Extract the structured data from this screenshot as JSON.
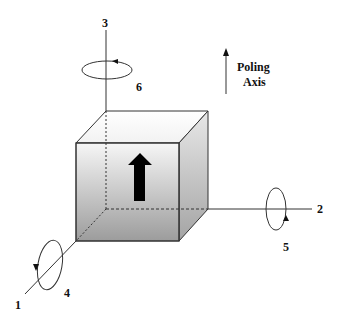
{
  "diagram": {
    "type": "piezoelectric-axes-cube",
    "axes": [
      {
        "id": "axis-1",
        "label": "1",
        "direction": "front-left diagonal"
      },
      {
        "id": "axis-2",
        "label": "2",
        "direction": "right"
      },
      {
        "id": "axis-3",
        "label": "3",
        "direction": "up"
      }
    ],
    "rotations": [
      {
        "id": "rotation-4",
        "label": "4",
        "about_axis": "1"
      },
      {
        "id": "rotation-5",
        "label": "5",
        "about_axis": "2"
      },
      {
        "id": "rotation-6",
        "label": "6",
        "about_axis": "3"
      }
    ],
    "legend": {
      "line1": "Poling",
      "line2": "Axis"
    },
    "colors": {
      "line": "#333333",
      "cube_gradient_top": "#f4f4f4",
      "cube_gradient_bottom": "#9a9a9a",
      "arrow": "#000000"
    }
  }
}
